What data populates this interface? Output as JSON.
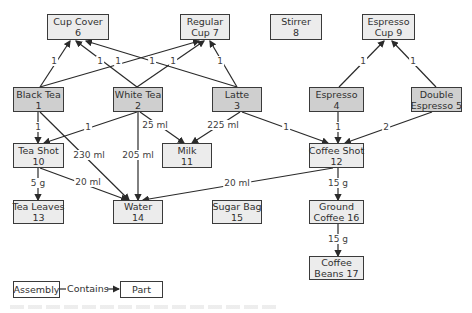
{
  "diagram": {
    "nodes": [
      {
        "id": "6",
        "line1": "Cup Cover",
        "line2": "6",
        "kind": "part",
        "x": 47,
        "y": 14,
        "w": 62,
        "h": 26
      },
      {
        "id": "7",
        "line1": "Regular",
        "line2": "Cup 7",
        "kind": "part",
        "x": 180,
        "y": 14,
        "w": 50,
        "h": 26
      },
      {
        "id": "8",
        "line1": "Stirrer",
        "line2": "8",
        "kind": "part",
        "x": 270,
        "y": 14,
        "w": 52,
        "h": 26
      },
      {
        "id": "9",
        "line1": "Espresso",
        "line2": "Cup 9",
        "kind": "part",
        "x": 362,
        "y": 14,
        "w": 53,
        "h": 26
      },
      {
        "id": "1",
        "line1": "Black Tea",
        "line2": "1",
        "kind": "assembly",
        "x": 13,
        "y": 87,
        "w": 51,
        "h": 25
      },
      {
        "id": "2",
        "line1": "White Tea",
        "line2": "2",
        "kind": "assembly",
        "x": 113,
        "y": 87,
        "w": 50,
        "h": 25
      },
      {
        "id": "3",
        "line1": "Latte",
        "line2": "3",
        "kind": "assembly",
        "x": 212,
        "y": 87,
        "w": 50,
        "h": 25
      },
      {
        "id": "4",
        "line1": "Espresso",
        "line2": "4",
        "kind": "assembly",
        "x": 309,
        "y": 87,
        "w": 55,
        "h": 25
      },
      {
        "id": "5",
        "line1": "Double",
        "line2": "Espresso 5",
        "kind": "assembly",
        "x": 411,
        "y": 87,
        "w": 51,
        "h": 25
      },
      {
        "id": "10",
        "line1": "Tea Shot",
        "line2": "10",
        "kind": "part",
        "x": 13,
        "y": 143,
        "w": 51,
        "h": 25
      },
      {
        "id": "11",
        "line1": "Milk",
        "line2": "11",
        "kind": "part",
        "x": 162,
        "y": 143,
        "w": 50,
        "h": 25
      },
      {
        "id": "12",
        "line1": "Coffee Shot",
        "line2": "12",
        "kind": "part",
        "x": 309,
        "y": 143,
        "w": 55,
        "h": 25
      },
      {
        "id": "13",
        "line1": "Tea Leaves",
        "line2": "13",
        "kind": "part",
        "x": 13,
        "y": 200,
        "w": 51,
        "h": 24
      },
      {
        "id": "14",
        "line1": "Water",
        "line2": "14",
        "kind": "part",
        "x": 113,
        "y": 200,
        "w": 50,
        "h": 24
      },
      {
        "id": "15",
        "line1": "Sugar Bag",
        "line2": "15",
        "kind": "part",
        "x": 212,
        "y": 200,
        "w": 50,
        "h": 24
      },
      {
        "id": "16",
        "line1": "Ground",
        "line2": "Coffee 16",
        "kind": "part",
        "x": 309,
        "y": 200,
        "w": 55,
        "h": 24
      },
      {
        "id": "17",
        "line1": "Coffee",
        "line2": "Beans 17",
        "kind": "part",
        "x": 309,
        "y": 256,
        "w": 55,
        "h": 24
      }
    ],
    "edges": [
      {
        "from": [
          40,
          87
        ],
        "to": [
          70,
          41
        ],
        "label": "1",
        "lx": 54,
        "ly": 61
      },
      {
        "from": [
          40,
          87
        ],
        "to": [
          199,
          41
        ],
        "label": "1",
        "lx": 118,
        "ly": 61
      },
      {
        "from": [
          137,
          87
        ],
        "to": [
          76,
          41
        ],
        "label": "1",
        "lx": 100,
        "ly": 61
      },
      {
        "from": [
          137,
          87
        ],
        "to": [
          204,
          41
        ],
        "label": "1",
        "lx": 173,
        "ly": 61
      },
      {
        "from": [
          237,
          87
        ],
        "to": [
          86,
          41
        ],
        "label": "1",
        "lx": 152,
        "ly": 61
      },
      {
        "from": [
          237,
          87
        ],
        "to": [
          210,
          41
        ],
        "label": "1",
        "lx": 220,
        "ly": 61
      },
      {
        "from": [
          339,
          87
        ],
        "to": [
          384,
          41
        ],
        "label": "1",
        "lx": 363,
        "ly": 61
      },
      {
        "from": [
          436,
          87
        ],
        "to": [
          392,
          41
        ],
        "label": "1",
        "lx": 413,
        "ly": 61
      },
      {
        "from": [
          38,
          112
        ],
        "to": [
          38,
          143
        ],
        "label": "1",
        "lx": 38,
        "ly": 127
      },
      {
        "from": [
          137,
          112
        ],
        "to": [
          44,
          143
        ],
        "label": "1",
        "lx": 88,
        "ly": 127
      },
      {
        "from": [
          40,
          112
        ],
        "to": [
          129,
          200
        ],
        "label": "230 ml",
        "lx": 89,
        "ly": 155
      },
      {
        "from": [
          138,
          112
        ],
        "to": [
          138,
          200
        ],
        "label": "205 ml",
        "lx": 138,
        "ly": 155
      },
      {
        "from": [
          140,
          112
        ],
        "to": [
          184,
          143
        ],
        "label": "25 ml",
        "lx": 155,
        "ly": 125
      },
      {
        "from": [
          240,
          112
        ],
        "to": [
          192,
          143
        ],
        "label": "225 ml",
        "lx": 223,
        "ly": 125
      },
      {
        "from": [
          242,
          112
        ],
        "to": [
          328,
          143
        ],
        "label": "1",
        "lx": 286,
        "ly": 127
      },
      {
        "from": [
          338,
          112
        ],
        "to": [
          338,
          143
        ],
        "label": "1",
        "lx": 338,
        "ly": 127
      },
      {
        "from": [
          432,
          112
        ],
        "to": [
          345,
          143
        ],
        "label": "2",
        "lx": 386,
        "ly": 127
      },
      {
        "from": [
          40,
          168
        ],
        "to": [
          127,
          200
        ],
        "label": "20 ml",
        "lx": 88,
        "ly": 182
      },
      {
        "from": [
          38,
          168
        ],
        "to": [
          38,
          200
        ],
        "label": "5 g",
        "lx": 38,
        "ly": 183
      },
      {
        "from": [
          333,
          168
        ],
        "to": [
          143,
          200
        ],
        "label": "20 ml",
        "lx": 237,
        "ly": 183
      },
      {
        "from": [
          338,
          168
        ],
        "to": [
          338,
          200
        ],
        "label": "15 g",
        "lx": 338,
        "ly": 183
      },
      {
        "from": [
          338,
          224
        ],
        "to": [
          338,
          256
        ],
        "label": "15 g",
        "lx": 338,
        "ly": 239
      }
    ]
  },
  "legend": {
    "assembly": "Assembly",
    "contains": "Contains",
    "part": "Part"
  },
  "colors": {
    "assembly_fill": "#cfcfcf",
    "part_fill": "#ececec",
    "edge": "#2a2a2a"
  }
}
